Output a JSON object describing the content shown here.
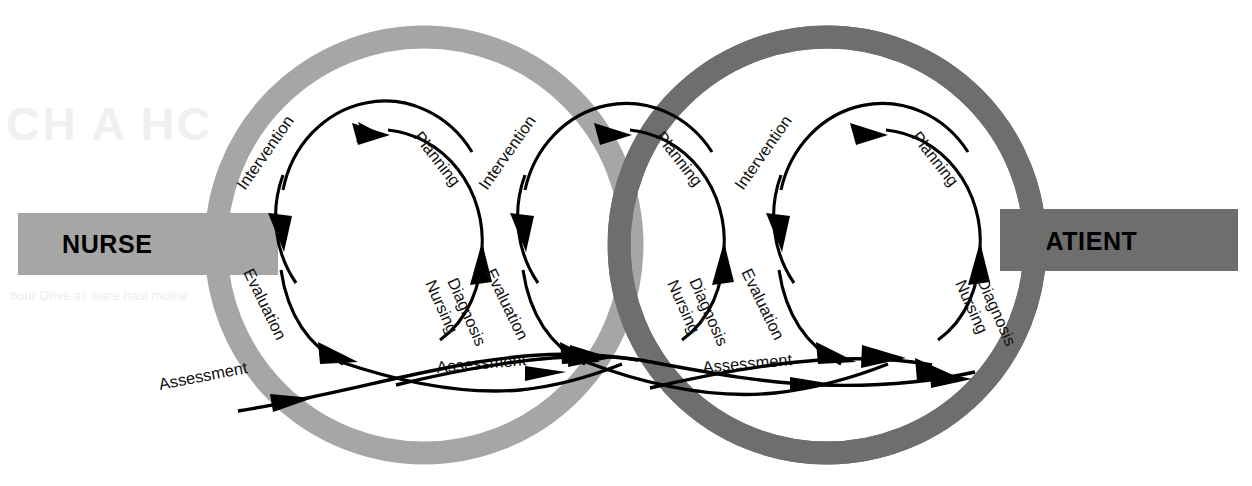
{
  "diagram": {
    "endpoints": {
      "left_label": "NURSE",
      "right_label": "PATIENT"
    },
    "colors": {
      "nurse_ring": "#a6a6a6",
      "patient_ring": "#6e6e6e",
      "nurse_bar": "#a6a6a6",
      "patient_bar": "#6e6e6e",
      "line": "#000000",
      "background": "#ffffff"
    },
    "cycles": [
      {
        "id": "nurse-cycle",
        "owner": "NURSE",
        "steps": [
          {
            "key": "intervention",
            "label": "Intervention"
          },
          {
            "key": "evaluation",
            "label": "Evaluation"
          },
          {
            "key": "assessment",
            "label": "Assessment"
          },
          {
            "key": "nursing-diagnosis",
            "label": "Nursing\nDiagnosis"
          },
          {
            "key": "planning",
            "label": "Planning"
          }
        ]
      },
      {
        "id": "shared-cycle",
        "owner": "NURSE-PATIENT",
        "steps": [
          {
            "key": "intervention",
            "label": "Intervention"
          },
          {
            "key": "evaluation",
            "label": "Evaluation"
          },
          {
            "key": "assessment",
            "label": "Assessment"
          },
          {
            "key": "nursing-diagnosis",
            "label": "Nursing\nDiagnosis"
          },
          {
            "key": "planning",
            "label": "Planning"
          }
        ]
      },
      {
        "id": "patient-cycle",
        "owner": "PATIENT",
        "steps": [
          {
            "key": "intervention",
            "label": "Intervention"
          },
          {
            "key": "evaluation",
            "label": "Evaluation"
          },
          {
            "key": "assessment",
            "label": "Assessment"
          },
          {
            "key": "nursing-diagnosis",
            "label": "Nursing\nDiagnosis"
          },
          {
            "key": "planning",
            "label": "Planning"
          }
        ]
      }
    ],
    "labels": {
      "intervention_1": "Intervention",
      "planning_1": "Planning",
      "evaluation_1": "Evaluation",
      "nursing_1a": "Nursing",
      "nursing_1b": "Diagnosis",
      "assessment_1": "Assessment",
      "intervention_2": "Intervention",
      "planning_2": "Planning",
      "evaluation_2": "Evaluation",
      "nursing_2a": "Nursing",
      "nursing_2b": "Diagnosis",
      "assessment_2": "Assessment",
      "intervention_3": "Intervention",
      "planning_3": "Planning",
      "evaluation_3": "Evaluation",
      "nursing_3a": "Nursing",
      "nursing_3b": "Diagnosis",
      "assessment_3": "Assessment"
    }
  }
}
